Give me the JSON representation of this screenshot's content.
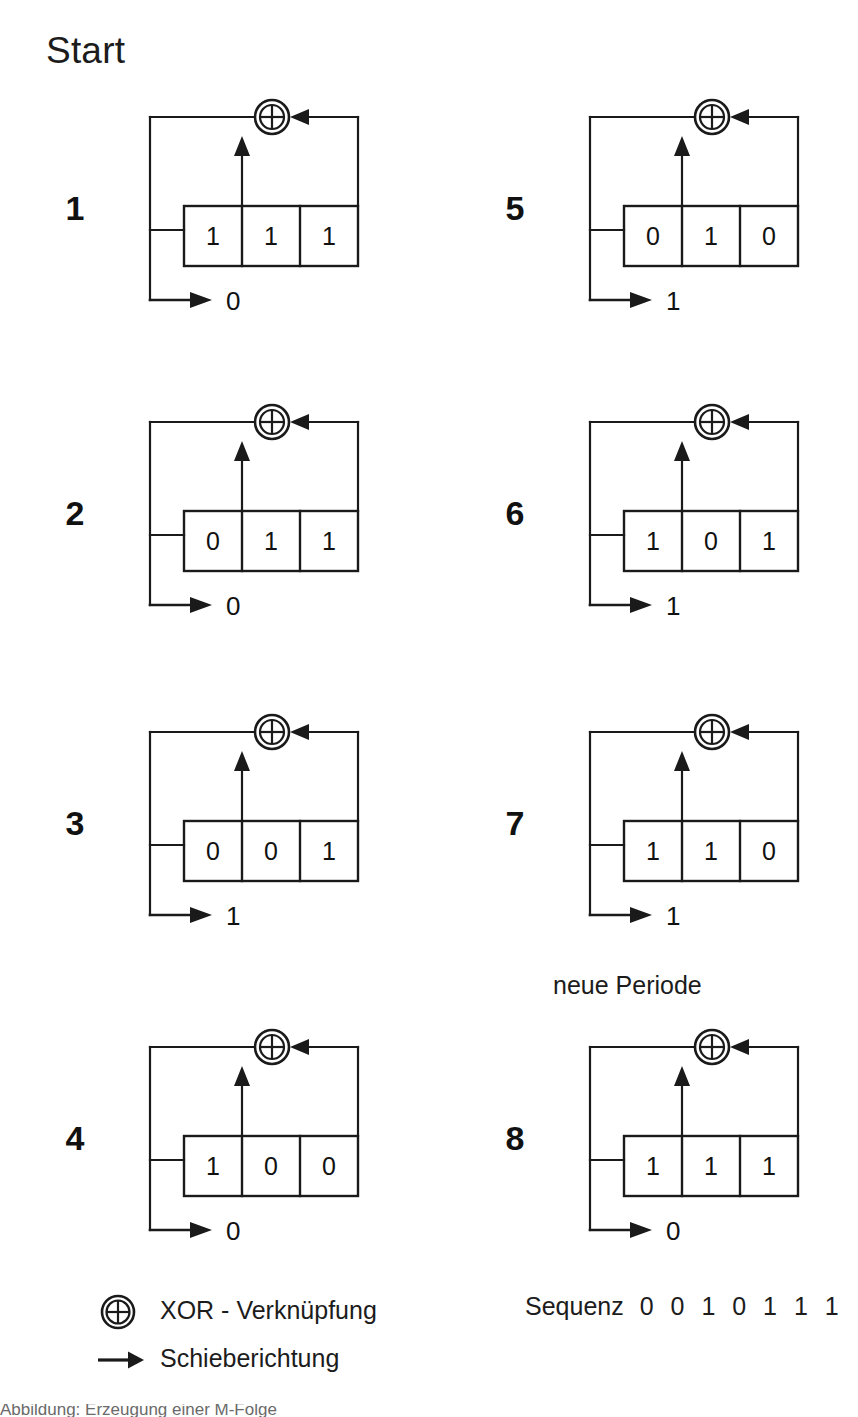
{
  "title": "Start",
  "period_label": "neue Periode",
  "steps": [
    {
      "number": "1",
      "cells": [
        "1",
        "1",
        "1"
      ],
      "output": "0",
      "column": "left",
      "row": 0,
      "period_marker": false
    },
    {
      "number": "2",
      "cells": [
        "0",
        "1",
        "1"
      ],
      "output": "0",
      "column": "left",
      "row": 1,
      "period_marker": false
    },
    {
      "number": "3",
      "cells": [
        "0",
        "0",
        "1"
      ],
      "output": "1",
      "column": "left",
      "row": 2,
      "period_marker": false
    },
    {
      "number": "4",
      "cells": [
        "1",
        "0",
        "0"
      ],
      "output": "0",
      "column": "left",
      "row": 3,
      "period_marker": false
    },
    {
      "number": "5",
      "cells": [
        "0",
        "1",
        "0"
      ],
      "output": "1",
      "column": "right",
      "row": 0,
      "period_marker": false
    },
    {
      "number": "6",
      "cells": [
        "1",
        "0",
        "1"
      ],
      "output": "1",
      "column": "right",
      "row": 1,
      "period_marker": false
    },
    {
      "number": "7",
      "cells": [
        "1",
        "1",
        "0"
      ],
      "output": "1",
      "column": "right",
      "row": 2,
      "period_marker": false
    },
    {
      "number": "8",
      "cells": [
        "1",
        "1",
        "1"
      ],
      "output": "0",
      "column": "right",
      "row": 3,
      "period_marker": true
    }
  ],
  "legend": {
    "xor_icon": "xor-circle-icon",
    "xor_label": "XOR - Verknüpfung",
    "shift_icon": "arrow-right-icon",
    "shift_label": "Schieberichtung"
  },
  "sequence": {
    "label": "Sequenz",
    "bits": "0 0 1 0 1 1 1"
  },
  "footer": {
    "caption_fragment": "Abbildung: Erzeugung einer M-Folge"
  },
  "colors": {
    "stroke": "#1a1a1a",
    "text": "#111111",
    "background": "#ffffff"
  }
}
